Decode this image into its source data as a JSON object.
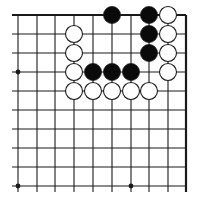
{
  "diagram": {
    "type": "go-board-fragment",
    "columns": 10,
    "rows": 10,
    "edges": {
      "top": true,
      "right": true,
      "left": false,
      "bottom": false
    },
    "grid": {
      "x": [
        18,
        37,
        55,
        74,
        93,
        112,
        131,
        149,
        168,
        186
      ],
      "y": [
        15,
        34,
        53,
        72,
        91,
        110,
        129,
        148,
        167,
        186
      ],
      "stone_radius": 8.5
    },
    "colors": {
      "line": "#1a1a1a",
      "black_stone": "#0a0a0a",
      "white_stone": "#ffffff",
      "stone_outline": "#1a1a1a"
    },
    "star_points": [
      {
        "col": 0,
        "row": 3
      },
      {
        "col": 0,
        "row": 9
      },
      {
        "col": 6,
        "row": 9
      }
    ],
    "stones": [
      {
        "col": 5,
        "row": 0,
        "color": "black"
      },
      {
        "col": 7,
        "row": 0,
        "color": "black"
      },
      {
        "col": 8,
        "row": 0,
        "color": "white"
      },
      {
        "col": 3,
        "row": 1,
        "color": "white"
      },
      {
        "col": 7,
        "row": 1,
        "color": "black"
      },
      {
        "col": 8,
        "row": 1,
        "color": "white"
      },
      {
        "col": 3,
        "row": 2,
        "color": "white"
      },
      {
        "col": 7,
        "row": 2,
        "color": "black"
      },
      {
        "col": 8,
        "row": 2,
        "color": "white"
      },
      {
        "col": 3,
        "row": 3,
        "color": "white"
      },
      {
        "col": 4,
        "row": 3,
        "color": "black"
      },
      {
        "col": 5,
        "row": 3,
        "color": "black"
      },
      {
        "col": 6,
        "row": 3,
        "color": "black"
      },
      {
        "col": 8,
        "row": 3,
        "color": "white"
      },
      {
        "col": 3,
        "row": 4,
        "color": "white"
      },
      {
        "col": 4,
        "row": 4,
        "color": "white"
      },
      {
        "col": 5,
        "row": 4,
        "color": "white"
      },
      {
        "col": 6,
        "row": 4,
        "color": "white"
      },
      {
        "col": 7,
        "row": 4,
        "color": "white"
      }
    ]
  }
}
